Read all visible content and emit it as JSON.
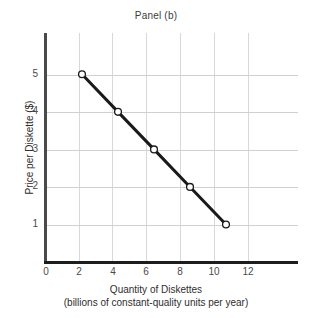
{
  "chart_data": {
    "type": "line",
    "title": "Panel (b)",
    "xlabel": "Quantity of Diskettes",
    "xlabel_sub": "(billions of constant-quality units per year)",
    "ylabel": "Price per Diskette ($)",
    "xlim": [
      0,
      14
    ],
    "ylim": [
      0,
      6.1
    ],
    "xticks": [
      0,
      2,
      4,
      6,
      8,
      10,
      12
    ],
    "yticks": [
      1,
      2,
      3,
      4,
      5
    ],
    "xtick_labels": [
      "0",
      "2",
      "4",
      "6",
      "8",
      "10",
      "12"
    ],
    "ytick_labels": [
      "1",
      "2",
      "3",
      "4",
      "5"
    ],
    "grid": true,
    "grid_color": "#d5d5d5",
    "legend": null,
    "series": [
      {
        "name": "Demand",
        "x": [
          2,
          4,
          6,
          8,
          10
        ],
        "y": [
          5,
          4,
          3,
          2,
          1
        ],
        "line_color": "#1a1a1a",
        "line_width": 3,
        "marker": "open-circle",
        "marker_face_color": "#ffffff",
        "marker_edge_color": "#1a1a1a"
      }
    ]
  },
  "figure": {
    "background": "#ffffff",
    "axis_color": "#3d3d3d",
    "text_color": "#3b3b3b"
  }
}
